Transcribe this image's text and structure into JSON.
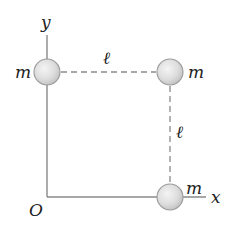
{
  "diagram": {
    "type": "physics-figure",
    "axes": {
      "x_label": "x",
      "y_label": "y",
      "origin_label": "O"
    },
    "masses": [
      {
        "id": "mass-top-left",
        "label": "m",
        "position": "(0, ℓ)"
      },
      {
        "id": "mass-top-right",
        "label": "m",
        "position": "(ℓ, ℓ)"
      },
      {
        "id": "mass-bottom-right",
        "label": "m",
        "position": "(ℓ, 0)"
      }
    ],
    "dimensions": [
      {
        "id": "top-side",
        "label": "ℓ",
        "between": [
          "mass-top-left",
          "mass-top-right"
        ]
      },
      {
        "id": "right-side",
        "label": "ℓ",
        "between": [
          "mass-top-right",
          "mass-bottom-right"
        ]
      }
    ],
    "colors": {
      "axis": "#8a8a8a",
      "dash": "#8a8a8a",
      "sphere_fill_light": "#f2f2f2",
      "sphere_fill_dark": "#c4c4c4",
      "sphere_stroke": "#9a9a9a",
      "text": "#222222"
    }
  }
}
